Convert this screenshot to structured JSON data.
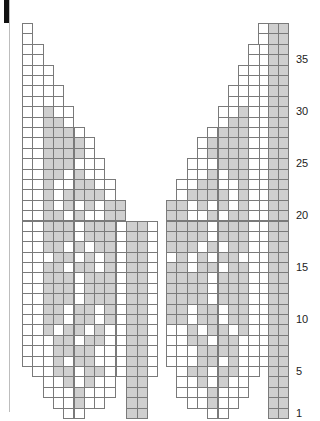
{
  "chart_data": {
    "type": "heatmap",
    "title": "",
    "row_labels": [
      "1",
      "5",
      "10",
      "15",
      "20",
      "25",
      "30",
      "35"
    ],
    "row_label_values": [
      1,
      5,
      10,
      15,
      20,
      25,
      30,
      35
    ],
    "total_rows": 38,
    "colors": {
      "filled": "#cfcfcf",
      "empty": "#ffffff",
      "line": "#7a7a7a"
    },
    "legend": {
      "x": "shaded stitch",
      "o": "plain stitch",
      ".": "no stitch"
    },
    "panels": [
      {
        "name": "left-panel",
        "x0": 22,
        "cols": 10,
        "rows_top_to_bottom": [
          "o.........",
          "o.........",
          "oo........",
          "oo........",
          "ooo.......",
          "ooo.......",
          "oooo......",
          "oooo......",
          "ooxoo.....",
          "ooxxo.....",
          "ooxxxo....",
          "ooxxxxo...",
          "ooxxxxo...",
          "ooxxxooo..",
          "ooxxoxoo..",
          "ooxooxxoo.",
          "ooxoxxxxo.",
          "ooxoxoxoxx",
          "ooxxoxooxx",
          "ooxxxoxxxx",
          "ooxxxoxxxx",
          "ooxxoxoxxx",
          "oooxxoxoxo",
          "ooxxoxxoxx",
          "ooxxxoxxxx",
          "ooxxxoxxxx",
          "ooxxxoxxxx",
          "ooxxoxxoxx",
          "ooxxoxxoxx",
          "ooxoxxoxoo",
          "oooxxoxxoo",
          "oooxxxxooo",
          "oooxoxxooo",
          ".ooxxoxxo.",
          "..ooxoxoo.",
          "..oooxooo.",
          "...ooxoo..",
          "....oo...."
        ]
      },
      {
        "name": "center-panel",
        "x0": 126,
        "cols": 4,
        "rows_top_to_bottom_start": 19,
        "pattern": "oxxo",
        "bottom_pattern": ".xx."
      },
      {
        "name": "right-panel",
        "x0": 166,
        "cols": 10,
        "mirror_of": "left-panel"
      },
      {
        "name": "right-edge",
        "x0": 258,
        "cols": 3,
        "pattern": "oxx"
      }
    ]
  }
}
